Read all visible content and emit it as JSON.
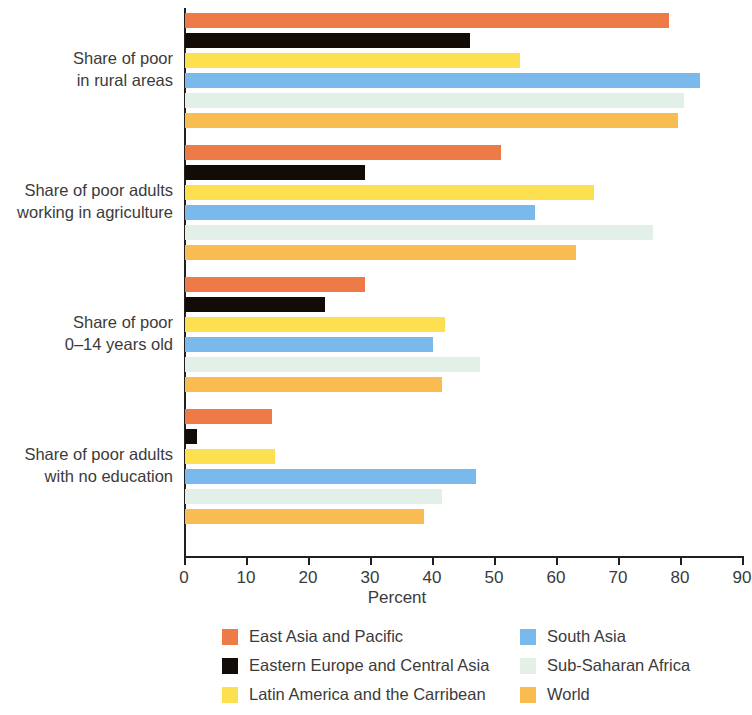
{
  "chart_data": {
    "type": "bar",
    "orientation": "horizontal",
    "title": "",
    "xlabel": "Percent",
    "ylabel": "",
    "xlim": [
      0,
      90
    ],
    "xticks": [
      0,
      10,
      20,
      30,
      40,
      50,
      60,
      70,
      80,
      90
    ],
    "xtick_labels": [
      "0",
      "10",
      "20",
      "30",
      "40",
      "50",
      "60",
      "70",
      "80",
      "90"
    ],
    "grid": false,
    "legend_position": "bottom",
    "categories": [
      "Share of poor\nin rural areas",
      "Share of poor adults\nworking in agriculture",
      "Share of poor\n0–14 years old",
      "Share of poor adults\nwith no education"
    ],
    "series": [
      {
        "name": "East Asia and Pacific",
        "color": "#ED7A47",
        "values": [
          78,
          51,
          29,
          14
        ]
      },
      {
        "name": "Eastern Europe and Central Asia",
        "color": "#120B06",
        "values": [
          46,
          29,
          22.5,
          2
        ]
      },
      {
        "name": "Latin America and the Carribean",
        "color": "#FDE04F",
        "values": [
          54,
          66,
          42,
          14.5
        ]
      },
      {
        "name": "South Asia",
        "color": "#79B9EC",
        "values": [
          83,
          56.5,
          40,
          47
        ]
      },
      {
        "name": "Sub-Saharan Africa",
        "color": "#E3F0E7",
        "values": [
          80.5,
          75.5,
          47.5,
          41.5
        ]
      },
      {
        "name": "World",
        "color": "#F9BC50",
        "values": [
          79.5,
          63,
          41.5,
          38.5
        ]
      }
    ]
  },
  "axis": {
    "x_title": "Percent"
  },
  "legend": {
    "left_items": [
      {
        "label": "East Asia and Pacific",
        "color": "#ED7A47"
      },
      {
        "label": "Eastern Europe and Central Asia",
        "color": "#120B06"
      },
      {
        "label": "Latin America and the Carribean",
        "color": "#FDE04F"
      }
    ],
    "right_items": [
      {
        "label": "South Asia",
        "color": "#79B9EC"
      },
      {
        "label": "Sub-Saharan Africa",
        "color": "#E3F0E7"
      },
      {
        "label": "World",
        "color": "#F9BC50"
      }
    ]
  }
}
